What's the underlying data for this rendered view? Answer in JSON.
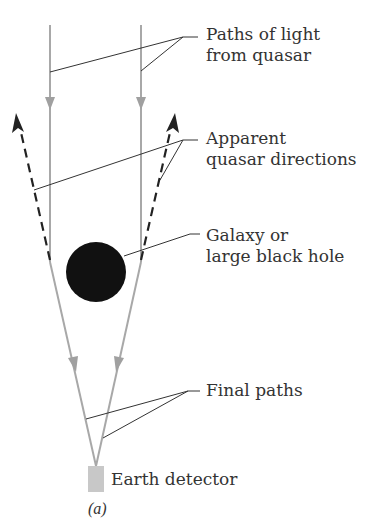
{
  "figure": {
    "caption": "(a)",
    "labels": {
      "light_paths_line1": "Paths of light",
      "light_paths_line2": "from quasar",
      "apparent_line1": "Apparent",
      "apparent_line2": "quasar directions",
      "lens_line1": "Galaxy or",
      "lens_line2": "large black hole",
      "final_paths": "Final paths",
      "detector": "Earth detector"
    },
    "colors": {
      "light_path": "#a8a8a8",
      "dashed_direction": "#222222",
      "lens": "#111111",
      "detector": "#c8c8c8",
      "leader_line": "#333333",
      "text": "#333333"
    }
  }
}
